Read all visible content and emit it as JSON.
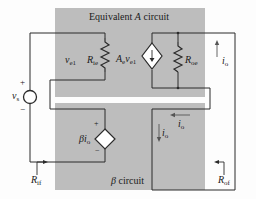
{
  "diagram": {
    "type": "feedback-amplifier-equivalent-circuit",
    "colors": {
      "block_fill": "#bdbdbd",
      "wire": "#2a2a2a",
      "background": "#fdfdfd"
    },
    "blocks": {
      "a_circuit": {
        "title_prefix": "Equivalent ",
        "title_var": "A",
        "title_suffix": " circuit"
      },
      "beta_circuit": {
        "title_var": "β",
        "title_suffix": " circuit"
      }
    },
    "labels": {
      "vs": {
        "main": "v",
        "sub": "s"
      },
      "vs_plus": "+",
      "vs_minus": "−",
      "ve1": {
        "main": "v",
        "sub": "e1"
      },
      "rie": {
        "main": "R",
        "sub": "ie"
      },
      "gain_source": {
        "main": "A",
        "sub1": "e",
        "mid": "v",
        "sub2": "e1"
      },
      "roe": {
        "main": "R",
        "sub": "oe"
      },
      "io_right": {
        "main": "i",
        "sub": "o"
      },
      "io_beta_horizontal": {
        "main": "i",
        "sub": "o"
      },
      "io_beta_vertical": {
        "main": "i",
        "sub": "o"
      },
      "beta_source": {
        "prefix": "β",
        "main": "i",
        "sub": "o"
      },
      "beta_plus": "+",
      "beta_minus": "−",
      "rif": {
        "main": "R",
        "sub": "if"
      },
      "rof": {
        "main": "R",
        "sub": "of"
      }
    }
  }
}
